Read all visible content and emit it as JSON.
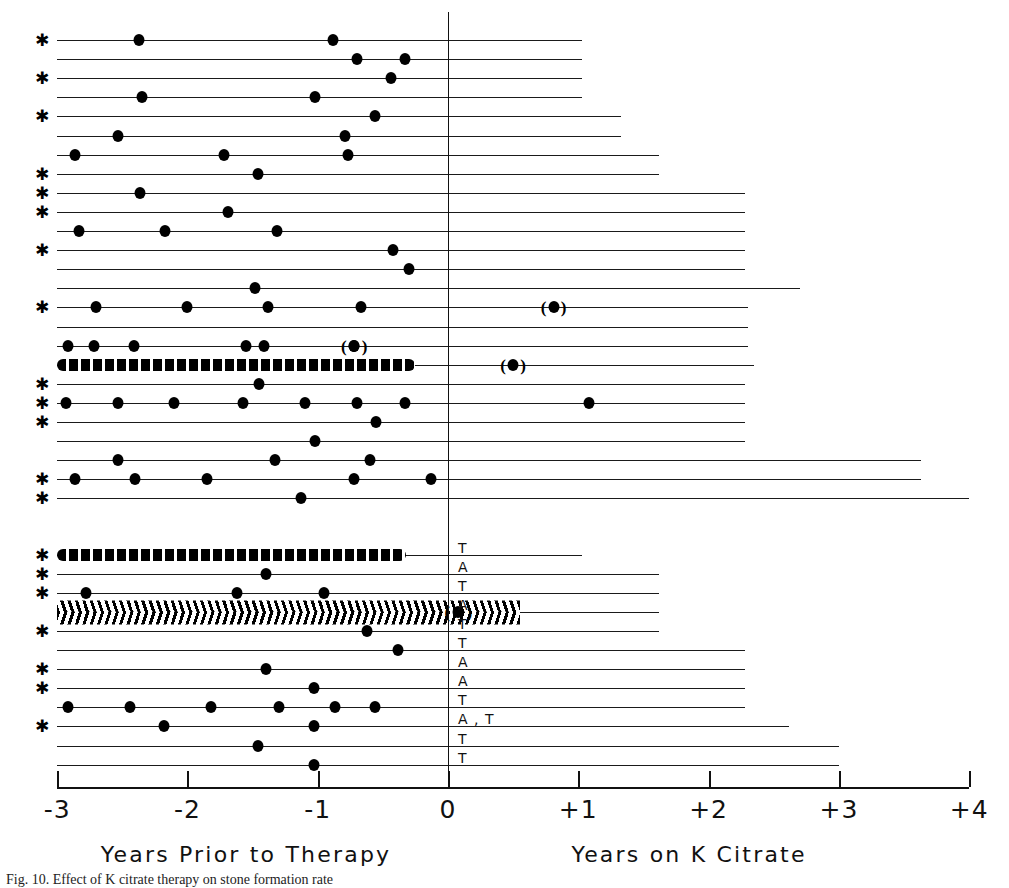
{
  "figure": {
    "caption": "Fig. 10.  Effect of K citrate therapy on stone formation rate",
    "star_symbol": "✱",
    "left_paren": "(",
    "right_paren": ")"
  },
  "axis": {
    "x_min": -3,
    "x_max": 4,
    "tick_labels": [
      "-3",
      "-2",
      "-1",
      "0",
      "+1",
      "+2",
      "+3",
      "+4"
    ],
    "tick_values": [
      -3,
      -2,
      -1,
      0,
      1,
      2,
      3,
      4
    ],
    "left_title": "Years  Prior  to  Therapy",
    "right_title": "Years  on  K  Citrate",
    "zero_label": "0"
  },
  "chart_data": {
    "type": "scatter",
    "title": "",
    "xlabel": "Years Prior to Therapy / Years on K Citrate",
    "ylabel": "",
    "xlim": [
      -3,
      4
    ],
    "grid": false,
    "legend": "none",
    "x_unit": "years relative to start of K citrate therapy",
    "groups": [
      {
        "name": "upper-group",
        "rows": [
          {
            "index": 1,
            "star": true,
            "start": -3.0,
            "end": 1.03,
            "events": [
              -2.37,
              -0.88
            ],
            "tag": ""
          },
          {
            "index": 2,
            "star": false,
            "start": -3.0,
            "end": 1.03,
            "events": [
              -0.7,
              -0.33
            ],
            "tag": ""
          },
          {
            "index": 3,
            "star": true,
            "start": -3.0,
            "end": 1.03,
            "events": [
              -0.44
            ],
            "tag": ""
          },
          {
            "index": 4,
            "star": false,
            "start": -3.0,
            "end": 1.03,
            "events": [
              -2.35,
              -1.02
            ],
            "tag": ""
          },
          {
            "index": 5,
            "star": true,
            "start": -3.0,
            "end": 1.33,
            "events": [
              -0.56
            ],
            "tag": ""
          },
          {
            "index": 6,
            "star": false,
            "start": -3.0,
            "end": 1.33,
            "events": [
              -2.53,
              -0.79
            ],
            "tag": ""
          },
          {
            "index": 7,
            "star": false,
            "start": -3.0,
            "end": 1.62,
            "events": [
              -2.86,
              -1.72,
              -0.77
            ],
            "tag": ""
          },
          {
            "index": 8,
            "star": true,
            "start": -3.0,
            "end": 1.62,
            "events": [
              -1.46
            ],
            "tag": ""
          },
          {
            "index": 9,
            "star": true,
            "start": -3.0,
            "end": 2.28,
            "events": [
              -2.36
            ],
            "tag": ""
          },
          {
            "index": 10,
            "star": true,
            "start": -3.0,
            "end": 2.28,
            "events": [
              -1.69
            ],
            "tag": ""
          },
          {
            "index": 11,
            "star": false,
            "start": -3.0,
            "end": 2.28,
            "events": [
              -2.83,
              -2.17,
              -1.31
            ],
            "tag": ""
          },
          {
            "index": 12,
            "star": true,
            "start": -3.0,
            "end": 2.28,
            "events": [
              -0.42
            ],
            "tag": ""
          },
          {
            "index": 13,
            "star": false,
            "start": -3.0,
            "end": 2.28,
            "events": [
              -0.3
            ],
            "tag": ""
          },
          {
            "index": 14,
            "star": false,
            "start": -3.0,
            "end": 2.7,
            "events": [
              -1.48
            ],
            "tag": ""
          },
          {
            "index": 15,
            "star": true,
            "start": -3.0,
            "end": 2.3,
            "events": [
              -2.7,
              -2.0,
              -1.38,
              -0.67,
              0.81
            ],
            "tag": ""
          },
          {
            "index": 16,
            "star": false,
            "start": -3.0,
            "end": 2.3,
            "events": [],
            "tag": ""
          },
          {
            "index": 17,
            "star": false,
            "start": -3.0,
            "end": 2.3,
            "events": [
              -2.92,
              -2.72,
              -2.41,
              -1.55,
              -1.41,
              -0.72
            ],
            "tag": ""
          },
          {
            "index": 18,
            "star": false,
            "start": -3.0,
            "end": 2.35,
            "events": [],
            "tag": "dense-run",
            "dense_from": -3.0,
            "dense_to": -0.25,
            "extra_events": [
              0.5
            ]
          },
          {
            "index": 19,
            "star": true,
            "start": -3.0,
            "end": 2.28,
            "events": [
              -1.45
            ],
            "tag": ""
          },
          {
            "index": 20,
            "star": true,
            "start": -3.0,
            "end": 2.28,
            "events": [
              -2.93,
              -2.53,
              -2.1,
              -1.57,
              -1.1,
              -0.7,
              -0.33,
              1.08
            ],
            "tag": ""
          },
          {
            "index": 21,
            "star": true,
            "start": -3.0,
            "end": 2.28,
            "events": [
              -0.55
            ],
            "tag": ""
          },
          {
            "index": 22,
            "star": false,
            "start": -3.0,
            "end": 2.28,
            "events": [
              -1.02
            ],
            "tag": ""
          },
          {
            "index": 23,
            "star": false,
            "start": -3.0,
            "end": 3.63,
            "events": [
              -2.53,
              -1.33,
              -0.6
            ],
            "tag": ""
          },
          {
            "index": 24,
            "star": true,
            "start": -3.0,
            "end": 3.63,
            "events": [
              -2.86,
              -2.4,
              -1.85,
              -0.72,
              -0.13
            ],
            "tag": ""
          },
          {
            "index": 25,
            "star": true,
            "start": -3.0,
            "end": 4.0,
            "events": [
              -1.13
            ],
            "tag": ""
          }
        ]
      },
      {
        "name": "lower-group",
        "rows": [
          {
            "index": 26,
            "star": true,
            "start": -3.0,
            "end": 1.03,
            "events": [],
            "tag": "T",
            "dense_from": -3.0,
            "dense_to": -0.32
          },
          {
            "index": 27,
            "star": true,
            "start": -3.0,
            "end": 1.62,
            "events": [
              -1.4
            ],
            "tag": "A"
          },
          {
            "index": 28,
            "star": true,
            "start": -3.0,
            "end": 1.62,
            "events": [
              -2.78,
              -1.62,
              -0.95
            ],
            "tag": "T"
          },
          {
            "index": 29,
            "star": false,
            "start": -3.0,
            "end": 1.62,
            "events": [
              0.08
            ],
            "tag": "A",
            "hatched": true
          },
          {
            "index": 30,
            "star": true,
            "start": -3.0,
            "end": 1.62,
            "events": [
              -0.62
            ],
            "tag": "T"
          },
          {
            "index": 31,
            "star": false,
            "start": -3.0,
            "end": 2.28,
            "events": [
              -0.38
            ],
            "tag": "T"
          },
          {
            "index": 32,
            "star": true,
            "start": -3.0,
            "end": 2.28,
            "events": [
              -1.4
            ],
            "tag": "A"
          },
          {
            "index": 33,
            "star": true,
            "start": -3.0,
            "end": 2.28,
            "events": [
              -1.03
            ],
            "tag": "A"
          },
          {
            "index": 34,
            "star": false,
            "start": -3.0,
            "end": 2.28,
            "events": [
              -2.92,
              -2.44,
              -1.82,
              -1.3,
              -0.87,
              -0.56
            ],
            "tag": "T"
          },
          {
            "index": 35,
            "star": true,
            "start": -3.0,
            "end": 2.62,
            "events": [
              -2.18,
              -1.03
            ],
            "tag": "A , T"
          },
          {
            "index": 36,
            "star": false,
            "start": -3.0,
            "end": 3.0,
            "events": [
              -1.46
            ],
            "tag": "T"
          },
          {
            "index": 37,
            "star": false,
            "start": -3.0,
            "end": 3.0,
            "events": [
              -1.03
            ],
            "tag": "T"
          }
        ]
      }
    ]
  }
}
